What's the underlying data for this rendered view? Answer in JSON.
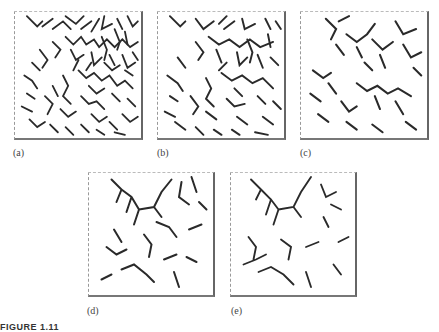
{
  "figure": {
    "panels": [
      {
        "id": "a",
        "label": "(a)",
        "density": 1.0
      },
      {
        "id": "b",
        "label": "(b)",
        "density": 0.8
      },
      {
        "id": "c",
        "label": "(c)",
        "density": 0.6
      },
      {
        "id": "d",
        "label": "(d)",
        "density": 0.45
      },
      {
        "id": "e",
        "label": "(e)",
        "density": 0.38
      }
    ],
    "caption": "FIGURE 1.11",
    "colors": {
      "lines": "#2a2a2a",
      "background": "#ffffff"
    }
  }
}
